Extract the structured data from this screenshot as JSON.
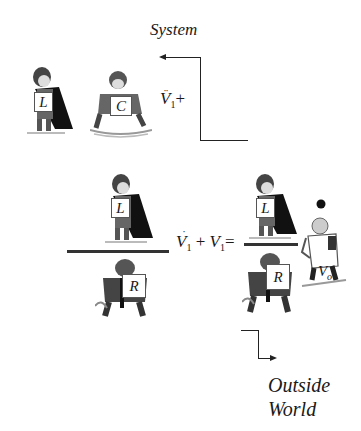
{
  "diagram": {
    "top_label": "System",
    "bottom_label_line1": "Outside",
    "bottom_label_line2": "World",
    "top_expression": {
      "var": "V",
      "sub": "1",
      "dots": "double",
      "suffix": "+"
    },
    "main_equation": {
      "term1_var": "V",
      "term1_sub": "1",
      "term1_dots": "single",
      "plus": "+",
      "term2_var": "V",
      "term2_sub": "1",
      "equals": "="
    },
    "characters": {
      "top_left_inductor": "L",
      "top_capacitor": "C",
      "left_fraction_numerator": "L",
      "left_fraction_denominator": "R",
      "right_fraction_numerator": "L",
      "right_fraction_denominator": "R",
      "output_voltage": "V",
      "output_voltage_sub": "o"
    },
    "icons": {
      "inductor": "caped-superhero-figure",
      "capacitor": "crouching-figure",
      "resistor": "resisting-figure",
      "voltage_source": "juggling-figure",
      "arrow_in": "arrow-left",
      "arrow_out": "arrow-right"
    },
    "colors": {
      "ink": "#1a1a1a",
      "background": "#ffffff"
    }
  }
}
